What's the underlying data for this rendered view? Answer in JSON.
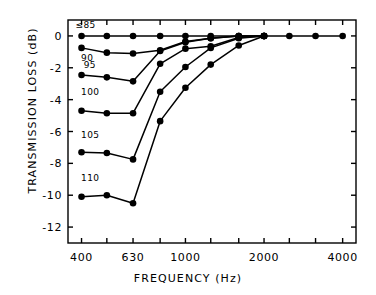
{
  "chart_data": {
    "type": "line",
    "title": "",
    "xlabel": "FREQUENCY  (Hz)",
    "ylabel": "TRANSMISSION LOSS  (dB)",
    "xscale": "log",
    "xlim": [
      355,
      4500
    ],
    "ylim": [
      -13,
      1
    ],
    "grid": false,
    "legend_position": "inline-left",
    "x": [
      400,
      500,
      630,
      800,
      1000,
      1250,
      1600,
      2000,
      2500,
      3150,
      4000
    ],
    "xticks": [
      400,
      630,
      1000,
      2000,
      4000
    ],
    "xticklabels": [
      "400",
      "630",
      "1000",
      "2000",
      "4000"
    ],
    "xminorticks": [
      400,
      500,
      630,
      800,
      1000,
      1250,
      1600,
      2000,
      2500,
      3150,
      4000
    ],
    "yticks": [
      0,
      -2,
      -4,
      -6,
      -8,
      -10,
      -12
    ],
    "yticklabels": [
      "0",
      "-2",
      "-4",
      "-6",
      "-8",
      "-10",
      "-12"
    ],
    "series": [
      {
        "name": "≤85",
        "label": "≤85",
        "label_x": 400,
        "label_y": 0.62,
        "values": [
          0,
          0,
          0,
          0,
          0,
          0,
          0,
          0,
          0,
          0,
          0
        ]
      },
      {
        "name": "90",
        "label": "90",
        "label_x": 420,
        "label_y": -1.45,
        "values": [
          -0.75,
          -1.05,
          -1.1,
          -0.9,
          -0.35,
          -0.15,
          0,
          0,
          null,
          null,
          null
        ]
      },
      {
        "name": "95",
        "label": "95",
        "label_x": 430,
        "label_y": -1.9,
        "values": [
          -2.45,
          -2.6,
          -2.85,
          -0.95,
          -0.4,
          -0.15,
          0,
          0,
          null,
          null,
          null
        ]
      },
      {
        "name": "100",
        "label": "100",
        "label_x": 420,
        "label_y": -3.6,
        "values": [
          -4.7,
          -4.85,
          -4.85,
          -1.75,
          -0.8,
          -0.65,
          -0.1,
          0,
          null,
          null,
          null
        ]
      },
      {
        "name": "105",
        "label": "105",
        "label_x": 420,
        "label_y": -6.3,
        "values": [
          -7.3,
          -7.35,
          -7.75,
          -3.5,
          -1.95,
          -0.75,
          -0.15,
          0,
          null,
          null,
          null
        ]
      },
      {
        "name": "110",
        "label": "110",
        "label_x": 420,
        "label_y": -9.0,
        "values": [
          -10.1,
          -10.0,
          -10.5,
          -5.35,
          -3.25,
          -1.8,
          -0.6,
          0,
          null,
          null,
          null
        ]
      }
    ],
    "marker": "filled-circle",
    "line_color": "#000000",
    "marker_color": "#000000",
    "background": "#ffffff"
  },
  "figure": {
    "frame_color": "#000000",
    "axis_linewidth": 1.4
  }
}
